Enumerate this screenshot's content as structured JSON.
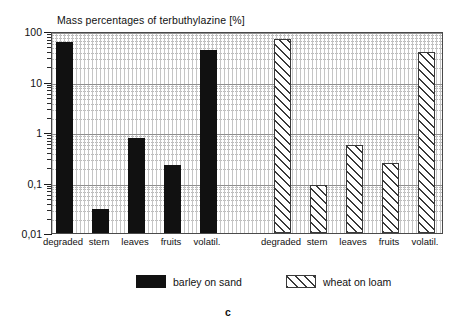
{
  "chart_data": {
    "type": "bar",
    "title": "Mass percentages of terbuthylazine [%]",
    "xlabel": "",
    "ylabel": "",
    "yscale": "log",
    "ylim": [
      0.01,
      100
    ],
    "ytick_labels": [
      "100",
      "10",
      "1",
      "0,1",
      "0,01"
    ],
    "ytick_values": [
      100,
      10,
      1,
      0.1,
      0.01
    ],
    "grid": true,
    "legend_position": "bottom",
    "caption": "c",
    "groups": [
      {
        "name": "barley on sand",
        "pattern": "solid",
        "color": "#111111",
        "categories": [
          "degraded",
          "stem",
          "leaves",
          "fruits",
          "volatil."
        ],
        "values": [
          60.0,
          0.03,
          0.75,
          0.22,
          42.0
        ]
      },
      {
        "name": "wheat on loam",
        "pattern": "diagonal-hatch",
        "color": "#3a3a3a",
        "categories": [
          "degraded",
          "stem",
          "leaves",
          "fruits",
          "volatil."
        ],
        "values": [
          70.0,
          0.09,
          0.55,
          0.24,
          38.0
        ]
      }
    ],
    "series": [
      {
        "name": "barley on sand",
        "values": [
          60.0,
          0.03,
          0.75,
          0.22,
          42.0
        ]
      },
      {
        "name": "wheat on loam",
        "values": [
          70.0,
          0.09,
          0.55,
          0.24,
          38.0
        ]
      }
    ],
    "categories": [
      "degraded",
      "stem",
      "leaves",
      "fruits",
      "volatil."
    ]
  },
  "legend": {
    "entries": [
      {
        "label": "barley on sand",
        "pattern": "solid"
      },
      {
        "label": "wheat on loam",
        "pattern": "diagonal-hatch"
      }
    ]
  },
  "caption": {
    "text": "c"
  }
}
